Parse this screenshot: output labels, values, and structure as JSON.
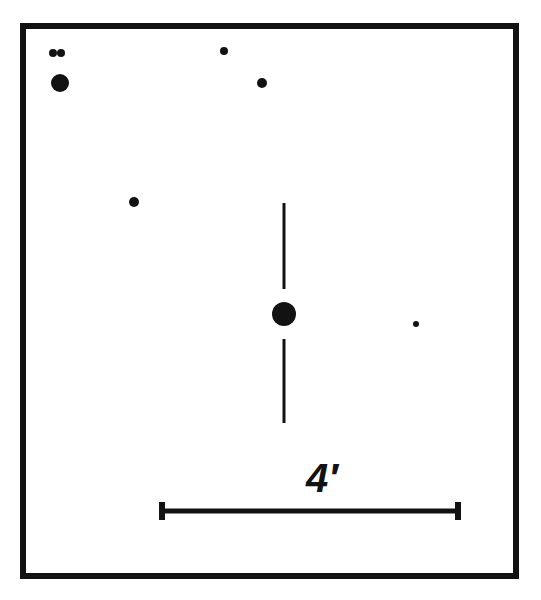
{
  "figure": {
    "kind": "astronomical-finder-chart",
    "background_color": "#ffffff",
    "ink_color": "#121212",
    "frame": {
      "x": 20,
      "y": 23,
      "width": 499,
      "height": 556,
      "stroke_width": 6
    },
    "scale_bar": {
      "label": "4′",
      "label_x": 322,
      "label_y": 492,
      "x1": 162,
      "x2": 458,
      "y": 511,
      "bar_thickness": 5,
      "tick_half_height": 9,
      "tick_thickness": 6
    },
    "target_marker": {
      "name": "target-tick-marks",
      "x": 284,
      "upper_y1": 203,
      "upper_y2": 289,
      "lower_y1": 339,
      "lower_y2": 423,
      "thickness": 3
    },
    "objects": [
      {
        "id": "star-a1",
        "cx": 53,
        "cy": 53,
        "r": 4,
        "note": "close pair west component"
      },
      {
        "id": "star-a2",
        "cx": 61,
        "cy": 53,
        "r": 4,
        "note": "close pair east component"
      },
      {
        "id": "star-b",
        "cx": 60,
        "cy": 83,
        "r": 9,
        "note": "bright northwest star"
      },
      {
        "id": "star-c",
        "cx": 224,
        "cy": 51,
        "r": 4,
        "note": "north star"
      },
      {
        "id": "star-d",
        "cx": 262,
        "cy": 83,
        "r": 5,
        "note": "north-northeast star"
      },
      {
        "id": "star-e",
        "cx": 134,
        "cy": 202,
        "r": 5,
        "note": "west star"
      },
      {
        "id": "star-target",
        "cx": 284,
        "cy": 314,
        "r": 12,
        "note": "marked target object"
      },
      {
        "id": "star-f",
        "cx": 416,
        "cy": 324,
        "r": 3,
        "note": "faint east star"
      }
    ]
  },
  "chart_data": {
    "type": "scatter",
    "title": "",
    "xlabel": "",
    "ylabel": "",
    "grid": false,
    "legend": null,
    "annotations": [
      {
        "text": "4′",
        "meaning": "scale bar length equals 4 arcminutes",
        "x": 322,
        "y": 492
      }
    ],
    "scale_bar_arcmin": 4,
    "scale_bar_pixel_length": 296,
    "marked_target": {
      "x": 284,
      "y": 314,
      "marker": "vertical tick pair"
    },
    "points": [
      {
        "x": 53,
        "y": 53,
        "size": 4
      },
      {
        "x": 61,
        "y": 53,
        "size": 4
      },
      {
        "x": 60,
        "y": 83,
        "size": 9
      },
      {
        "x": 224,
        "y": 51,
        "size": 4
      },
      {
        "x": 262,
        "y": 83,
        "size": 5
      },
      {
        "x": 134,
        "y": 202,
        "size": 5
      },
      {
        "x": 284,
        "y": 314,
        "size": 12
      },
      {
        "x": 416,
        "y": 324,
        "size": 3
      }
    ]
  }
}
